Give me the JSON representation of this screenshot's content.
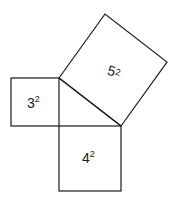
{
  "diagram": {
    "type": "pythagorean-theorem",
    "triangle": {
      "legs": [
        3,
        4
      ],
      "hypotenuse": 5
    },
    "squares": [
      {
        "id": "square-a",
        "base": "3",
        "exponent": "2",
        "label": "3²"
      },
      {
        "id": "square-b",
        "base": "4",
        "exponent": "2",
        "label": "4²"
      },
      {
        "id": "square-c",
        "base": "5",
        "exponent": "2",
        "label": "5²"
      }
    ],
    "colors": {
      "stroke": "#1a1a1a",
      "background": "#ffffff"
    }
  }
}
